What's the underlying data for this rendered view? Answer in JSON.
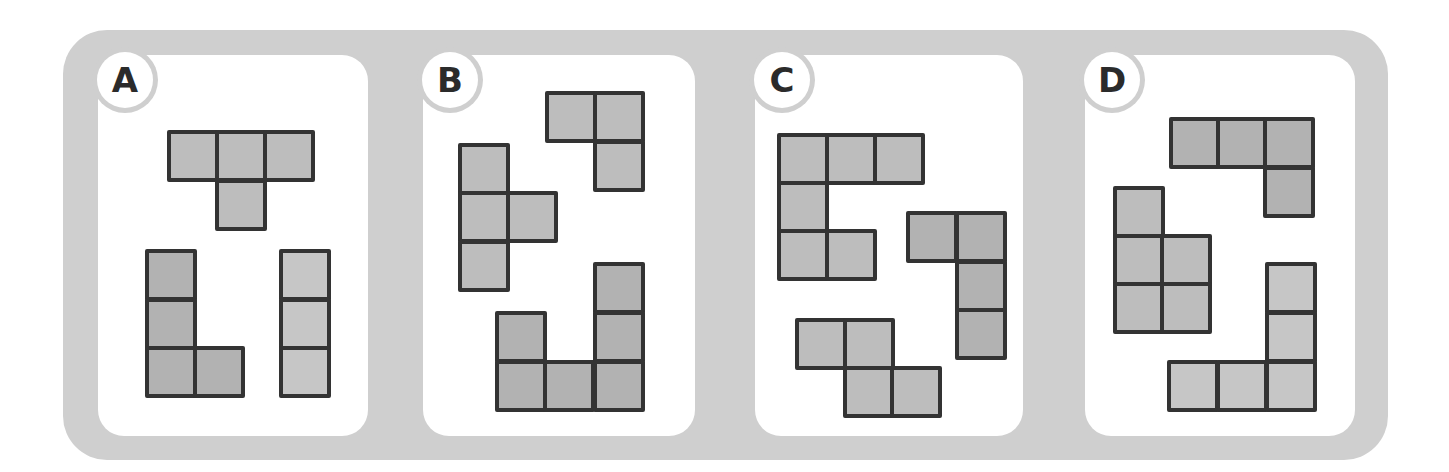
{
  "figure": {
    "colors": {
      "frame": "#cfcfcf",
      "card": "#ffffff",
      "cell_fill": "#bdbdbd",
      "cell_fill_dark": "#b2b2b2",
      "cell_fill_light": "#c6c6c6",
      "cell_border": "#333333",
      "label_text": "#2b2b2b"
    },
    "cell_pitch_px": 48
  },
  "panels": [
    {
      "label": "A",
      "card": {
        "x": 98,
        "y": 55,
        "w": 270,
        "h": 381
      },
      "pieces": [
        {
          "name": "T-tetromino",
          "fill": "#bdbdbd",
          "cells": [
            [
              167,
              130
            ],
            [
              215,
              130
            ],
            [
              263,
              130
            ],
            [
              215,
              179
            ]
          ]
        },
        {
          "name": "L-tetromino",
          "fill": "#b2b2b2",
          "cells": [
            [
              145,
              249
            ],
            [
              145,
              298
            ],
            [
              145,
              346
            ],
            [
              193,
              346
            ]
          ]
        },
        {
          "name": "I-tromino",
          "fill": "#c6c6c6",
          "cells": [
            [
              279,
              249
            ],
            [
              279,
              298
            ],
            [
              279,
              346
            ]
          ]
        }
      ]
    },
    {
      "label": "B",
      "card": {
        "x": 423,
        "y": 55,
        "w": 272,
        "h": 381
      },
      "pieces": [
        {
          "name": "corner-tromino",
          "fill": "#bdbdbd",
          "cells": [
            [
              545,
              91
            ],
            [
              593,
              91
            ],
            [
              593,
              140
            ]
          ]
        },
        {
          "name": "T-tetromino-vertical",
          "fill": "#bdbdbd",
          "cells": [
            [
              458,
              143
            ],
            [
              458,
              191
            ],
            [
              506,
              191
            ],
            [
              458,
              240
            ]
          ]
        },
        {
          "name": "U-hexomino",
          "fill": "#b2b2b2",
          "cells": [
            [
              593,
              262
            ],
            [
              495,
              311
            ],
            [
              593,
              311
            ],
            [
              495,
              360
            ],
            [
              543,
              360
            ],
            [
              593,
              360
            ]
          ]
        }
      ]
    },
    {
      "label": "C",
      "card": {
        "x": 755,
        "y": 55,
        "w": 268,
        "h": 381
      },
      "pieces": [
        {
          "name": "C-hexomino",
          "fill": "#bdbdbd",
          "cells": [
            [
              777,
              133
            ],
            [
              825,
              133
            ],
            [
              873,
              133
            ],
            [
              777,
              181
            ],
            [
              777,
              229
            ],
            [
              825,
              229
            ]
          ]
        },
        {
          "name": "J-tetromino",
          "fill": "#b2b2b2",
          "cells": [
            [
              906,
              211
            ],
            [
              955,
              211
            ],
            [
              955,
              260
            ],
            [
              955,
              308
            ]
          ]
        },
        {
          "name": "S-tetromino",
          "fill": "#bdbdbd",
          "cells": [
            [
              795,
              318
            ],
            [
              843,
              318
            ],
            [
              843,
              366
            ],
            [
              890,
              366
            ]
          ]
        }
      ]
    },
    {
      "label": "D",
      "card": {
        "x": 1085,
        "y": 55,
        "w": 270,
        "h": 381
      },
      "pieces": [
        {
          "name": "J-tetromino",
          "fill": "#b2b2b2",
          "cells": [
            [
              1169,
              117
            ],
            [
              1216,
              117
            ],
            [
              1263,
              117
            ],
            [
              1263,
              166
            ]
          ]
        },
        {
          "name": "P-pentomino",
          "fill": "#bdbdbd",
          "cells": [
            [
              1113,
              186
            ],
            [
              1113,
              234
            ],
            [
              1160,
              234
            ],
            [
              1113,
              282
            ],
            [
              1160,
              282
            ]
          ]
        },
        {
          "name": "V-pentomino",
          "fill": "#c6c6c6",
          "cells": [
            [
              1265,
              262
            ],
            [
              1265,
              311
            ],
            [
              1167,
              360
            ],
            [
              1216,
              360
            ],
            [
              1265,
              360
            ]
          ]
        }
      ]
    }
  ]
}
